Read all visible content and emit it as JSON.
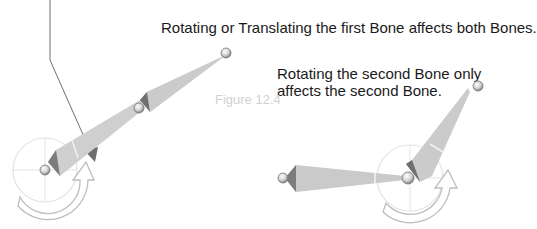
{
  "captions": {
    "first_bone": "Rotating or Translating the first Bone affects both Bones.",
    "second_bone": "Rotating the second Bone only affects the second Bone."
  },
  "figure_label": "Figure 12.4",
  "colors": {
    "bone_fill": "#c8c8c8",
    "bone_dark": "#8a8a8a",
    "pointer_line": "#707070",
    "gizmo_circle": "#e0e0e0",
    "rotate_arrow_stroke": "#bdbdbd",
    "text": "#1a1a1a",
    "figure_label": "#d2d2d2"
  }
}
